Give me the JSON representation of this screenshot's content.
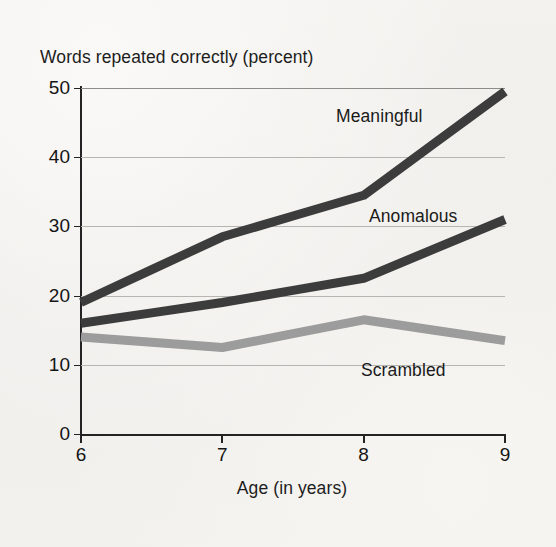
{
  "figure": {
    "y_axis_caption": "Words repeated correctly (percent)",
    "x_axis_caption": "Age (in years)"
  },
  "chart_data": {
    "type": "line",
    "title": "",
    "subtitle": "",
    "xlabel": "Age (in years)",
    "ylabel": "Words repeated correctly (percent)",
    "x": [
      6,
      7,
      8,
      9
    ],
    "xtick_labels": [
      "6",
      "7",
      "8",
      "9"
    ],
    "ytick_labels": [
      "0",
      "10",
      "20",
      "30",
      "40",
      "50"
    ],
    "yticks": [
      0,
      10,
      20,
      30,
      40,
      50
    ],
    "xlim": [
      6,
      9
    ],
    "ylim": [
      0,
      50
    ],
    "grid": "horizontal",
    "legend": "inline-labels",
    "series": [
      {
        "name": "Meaningful",
        "values": [
          19,
          28.5,
          34.5,
          49.5
        ],
        "color": "#3c3c3c",
        "label_position": "upper-right"
      },
      {
        "name": "Anomalous",
        "values": [
          16,
          19,
          22.5,
          31
        ],
        "color": "#3c3c3c",
        "label_position": "middle-right"
      },
      {
        "name": "Scrambled",
        "values": [
          14,
          12.5,
          16.5,
          13.5
        ],
        "color": "#9c9c9c",
        "label_position": "lower-right"
      }
    ],
    "colors": {
      "meaningful": "#3c3c3c",
      "anomalous": "#3c3c3c",
      "scrambled": "#9c9c9c",
      "axis": "#232323",
      "gridline": "#b7b5b2",
      "background": "#f2f0ed",
      "text": "#1a1a1a"
    }
  }
}
